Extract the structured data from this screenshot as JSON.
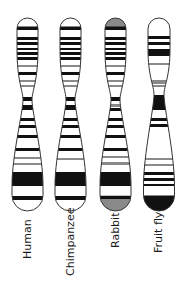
{
  "figure": {
    "title": "",
    "colors": {
      "dark": "#111111",
      "gray": "#8a8a8a",
      "light": "#ffffff",
      "outline": "#333333"
    },
    "chromosomes": [
      {
        "label": "Human",
        "cx": 27.5,
        "top": 18,
        "bottom": 211,
        "waist_y": 100,
        "top_half_width": 10.5,
        "waist_half_width": 4.5,
        "bottom_half_width": 15.5,
        "cap_fill": "#ffffff",
        "bands": [
          {
            "y": 27,
            "h": 3,
            "c": "dark"
          },
          {
            "y": 37,
            "h": 3,
            "c": "dark"
          },
          {
            "y": 42,
            "h": 3,
            "c": "dark"
          },
          {
            "y": 48,
            "h": 2,
            "c": "dark"
          },
          {
            "y": 52,
            "h": 3,
            "c": "dark"
          },
          {
            "y": 57,
            "h": 3,
            "c": "dark"
          },
          {
            "y": 65,
            "h": 2,
            "c": "gray"
          },
          {
            "y": 72,
            "h": 3,
            "c": "dark"
          },
          {
            "y": 80,
            "h": 2,
            "c": "gray"
          },
          {
            "y": 85,
            "h": 2,
            "c": "gray"
          },
          {
            "y": 97,
            "h": 4,
            "c": "dark"
          },
          {
            "y": 105,
            "h": 5,
            "c": "dark"
          },
          {
            "y": 118,
            "h": 3,
            "c": "dark"
          },
          {
            "y": 125,
            "h": 3,
            "c": "dark"
          },
          {
            "y": 135,
            "h": 3,
            "c": "dark"
          },
          {
            "y": 148,
            "h": 3,
            "c": "dark"
          },
          {
            "y": 157,
            "h": 2,
            "c": "gray"
          },
          {
            "y": 163,
            "h": 2,
            "c": "gray"
          },
          {
            "y": 172,
            "h": 14,
            "c": "dark"
          },
          {
            "y": 196,
            "h": 4,
            "c": "dark"
          }
        ]
      },
      {
        "label": "Chimpanzee",
        "cx": 70.5,
        "top": 18,
        "bottom": 211,
        "waist_y": 100,
        "top_half_width": 10.5,
        "waist_half_width": 4.5,
        "bottom_half_width": 15.5,
        "cap_fill": "#ffffff",
        "bands": [
          {
            "y": 27,
            "h": 3,
            "c": "dark"
          },
          {
            "y": 37,
            "h": 3,
            "c": "dark"
          },
          {
            "y": 42,
            "h": 3,
            "c": "dark"
          },
          {
            "y": 48,
            "h": 2,
            "c": "dark"
          },
          {
            "y": 52,
            "h": 3,
            "c": "dark"
          },
          {
            "y": 57,
            "h": 3,
            "c": "dark"
          },
          {
            "y": 65,
            "h": 2,
            "c": "gray"
          },
          {
            "y": 72,
            "h": 3,
            "c": "dark"
          },
          {
            "y": 80,
            "h": 2,
            "c": "gray"
          },
          {
            "y": 85,
            "h": 2,
            "c": "gray"
          },
          {
            "y": 97,
            "h": 4,
            "c": "dark"
          },
          {
            "y": 105,
            "h": 5,
            "c": "dark"
          },
          {
            "y": 118,
            "h": 3,
            "c": "dark"
          },
          {
            "y": 125,
            "h": 3,
            "c": "dark"
          },
          {
            "y": 135,
            "h": 3,
            "c": "dark"
          },
          {
            "y": 148,
            "h": 3,
            "c": "dark"
          },
          {
            "y": 158,
            "h": 2,
            "c": "gray"
          },
          {
            "y": 172,
            "h": 14,
            "c": "dark"
          },
          {
            "y": 196,
            "h": 4,
            "c": "dark"
          }
        ]
      },
      {
        "label": "Rabbit",
        "cx": 115.5,
        "top": 18,
        "bottom": 211,
        "waist_y": 100,
        "top_half_width": 10.5,
        "waist_half_width": 4.5,
        "bottom_half_width": 15.5,
        "cap_fill": "#8a8a8a",
        "bands": [
          {
            "y": 27,
            "h": 3,
            "c": "dark"
          },
          {
            "y": 37,
            "h": 3,
            "c": "dark"
          },
          {
            "y": 42,
            "h": 3,
            "c": "dark"
          },
          {
            "y": 48,
            "h": 2,
            "c": "dark"
          },
          {
            "y": 52,
            "h": 3,
            "c": "dark"
          },
          {
            "y": 57,
            "h": 3,
            "c": "dark"
          },
          {
            "y": 65,
            "h": 2,
            "c": "gray"
          },
          {
            "y": 72,
            "h": 3,
            "c": "dark"
          },
          {
            "y": 80,
            "h": 2,
            "c": "gray"
          },
          {
            "y": 85,
            "h": 2,
            "c": "gray"
          },
          {
            "y": 97,
            "h": 4,
            "c": "dark"
          },
          {
            "y": 104,
            "h": 3,
            "c": "gray"
          },
          {
            "y": 108,
            "h": 3,
            "c": "dark"
          },
          {
            "y": 118,
            "h": 3,
            "c": "dark"
          },
          {
            "y": 125,
            "h": 3,
            "c": "dark"
          },
          {
            "y": 135,
            "h": 3,
            "c": "dark"
          },
          {
            "y": 148,
            "h": 3,
            "c": "dark"
          },
          {
            "y": 156,
            "h": 2,
            "c": "gray"
          },
          {
            "y": 162,
            "h": 3,
            "c": "gray"
          },
          {
            "y": 172,
            "h": 14,
            "c": "dark"
          },
          {
            "y": 196,
            "h": 3,
            "c": "dark"
          }
        ],
        "bottom_cap_fill": "#8a8a8a"
      },
      {
        "label": "Fruit fly",
        "cx": 159,
        "top": 18,
        "bottom": 211,
        "waist_y": 95,
        "top_half_width": 11,
        "waist_half_width": 5,
        "bottom_half_width": 15.5,
        "cap_fill": "#ffffff",
        "bands": [
          {
            "y": 36,
            "h": 3,
            "c": "dark"
          },
          {
            "y": 42,
            "h": 3,
            "c": "dark"
          },
          {
            "y": 49,
            "h": 7,
            "c": "dark"
          },
          {
            "y": 63,
            "h": 2,
            "c": "gray"
          },
          {
            "y": 80,
            "h": 4,
            "c": "gray"
          },
          {
            "y": 85,
            "h": 2,
            "c": "gray"
          },
          {
            "y": 95,
            "h": 15,
            "c": "dark"
          },
          {
            "y": 118,
            "h": 3,
            "c": "dark"
          },
          {
            "y": 124,
            "h": 3,
            "c": "dark"
          },
          {
            "y": 158,
            "h": 2,
            "c": "gray"
          },
          {
            "y": 164,
            "h": 2,
            "c": "gray"
          },
          {
            "y": 172,
            "h": 3,
            "c": "dark"
          },
          {
            "y": 178,
            "h": 3,
            "c": "dark"
          },
          {
            "y": 184,
            "h": 2,
            "c": "dark"
          }
        ],
        "bottom_cap_fill": "#111111"
      }
    ]
  },
  "labels": {
    "human": "Human",
    "chimpanzee": "Chimpanzee",
    "rabbit": "Rabbit",
    "fruit_fly": "Fruit fly"
  }
}
